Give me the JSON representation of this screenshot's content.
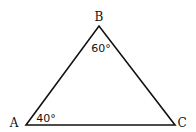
{
  "diagram": {
    "type": "triangle",
    "vertices": [
      {
        "name": "A",
        "angle": "40°"
      },
      {
        "name": "B",
        "angle": "60°"
      },
      {
        "name": "C",
        "angle": ""
      }
    ],
    "colors": {
      "stroke": "#111111",
      "background": "#ffffff"
    }
  }
}
